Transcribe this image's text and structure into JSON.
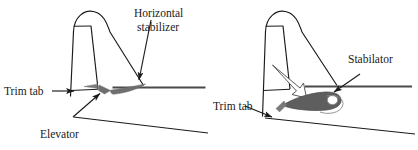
{
  "figure": {
    "background_color": "#ffffff",
    "line_color": "#1a1a1a",
    "control_surface_fill": "#6e6e6e",
    "trim_tab_fill": "#7a7a7a"
  },
  "left_diagram": {
    "name": "conventional-tail",
    "labels": {
      "horizontal_stabilizer_line1": "Horizontal",
      "horizontal_stabilizer_line2": "stabilizer",
      "trim_tab": "Trim tab",
      "elevator": "Elevator"
    },
    "parts": [
      "vertical-stabilizer",
      "rudder",
      "horizontal-stabilizer",
      "elevator",
      "trim-tab",
      "fuselage"
    ]
  },
  "right_diagram": {
    "name": "stabilator-tail",
    "labels": {
      "stabilator": "Stabilator",
      "trim_tab": "Trim tab"
    },
    "parts": [
      "vertical-stabilizer",
      "rudder",
      "stabilator",
      "stabilator-pivot",
      "anti-servo-trim-tab",
      "fuselage"
    ]
  }
}
